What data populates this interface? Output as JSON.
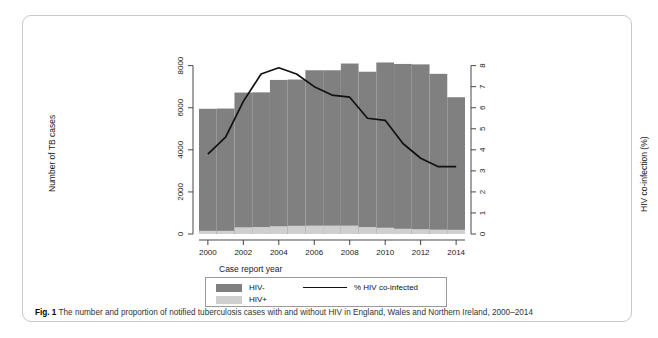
{
  "figure": {
    "label": "Fig. 1",
    "caption": "The number and proportion of notified tuberculosis cases with and without HIV in England, Wales and Northern Ireland, 2000–2014"
  },
  "legend": {
    "items": [
      {
        "label": "HIV-",
        "type": "swatch",
        "color": "#808080"
      },
      {
        "label": "HIV+",
        "type": "swatch",
        "color": "#cfcfcf"
      },
      {
        "label": "% HIV co-infected",
        "type": "line",
        "color": "#111111"
      }
    ]
  },
  "chart_data": {
    "type": "bar",
    "title": "",
    "xlabel": "Case report year",
    "ylabel": "Number of TB cases",
    "y2label": "HIV co-infection (%)",
    "categories": [
      2000,
      2001,
      2002,
      2003,
      2004,
      2005,
      2006,
      2007,
      2008,
      2009,
      2010,
      2011,
      2012,
      2013,
      2014
    ],
    "xtick_labels": [
      "2000",
      "2002",
      "2004",
      "2006",
      "2008",
      "2010",
      "2012",
      "2014"
    ],
    "xtick_values": [
      2000,
      2002,
      2004,
      2006,
      2008,
      2010,
      2012,
      2014
    ],
    "ytick_labels": [
      "0",
      "2000",
      "4000",
      "6000",
      "8000"
    ],
    "ytick_values": [
      0,
      2000,
      4000,
      6000,
      8000
    ],
    "ylim": [
      0,
      8600
    ],
    "y2tick_labels": [
      "0",
      "1",
      "2",
      "3",
      "4",
      "5",
      "6",
      "7",
      "8"
    ],
    "y2tick_values": [
      0,
      1,
      2,
      3,
      4,
      5,
      6,
      7,
      8
    ],
    "y2lim": [
      0,
      8.6
    ],
    "xlim": [
      1999.5,
      2014.5
    ],
    "grid": false,
    "legend_position": "below",
    "stacked": true,
    "series": [
      {
        "name": "HIV-",
        "color": "#808080",
        "values": [
          5800,
          5810,
          6400,
          6400,
          6950,
          6950,
          7380,
          7380,
          7700,
          7380,
          7850,
          7830,
          7830,
          7400,
          6300
        ]
      },
      {
        "name": "HIV+",
        "color": "#cfcfcf",
        "values": [
          150,
          150,
          320,
          330,
          370,
          390,
          400,
          400,
          400,
          330,
          300,
          250,
          230,
          210,
          200
        ]
      }
    ],
    "line_series": {
      "name": "% HIV co-infected",
      "color": "#111111",
      "axis": "right",
      "x": [
        2000,
        2001,
        2002,
        2003,
        2004,
        2005,
        2006,
        2007,
        2008,
        2009,
        2010,
        2011,
        2012,
        2013,
        2014
      ],
      "values": [
        3.8,
        4.6,
        6.3,
        7.6,
        7.9,
        7.6,
        7.0,
        6.6,
        6.5,
        5.5,
        5.4,
        4.3,
        3.6,
        3.2,
        3.2
      ]
    }
  }
}
